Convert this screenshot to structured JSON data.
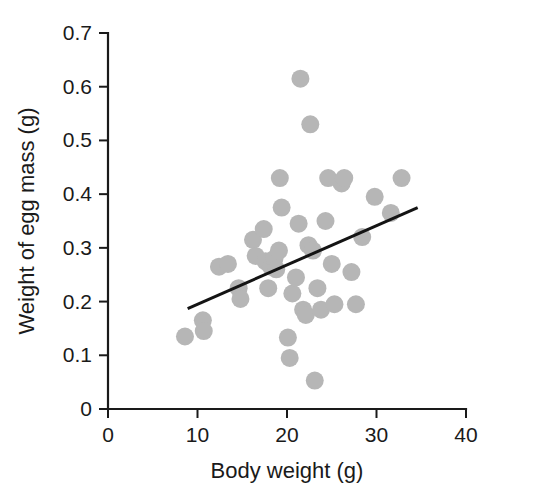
{
  "chart_data": {
    "type": "scatter",
    "title": "",
    "subtitle": "",
    "xlabel": "Body weight (g)",
    "ylabel": "Weight of egg mass (g)",
    "xlim": [
      0,
      40
    ],
    "ylim": [
      0,
      0.7
    ],
    "xticks": [
      0,
      10,
      20,
      30,
      40
    ],
    "yticks": [
      0,
      0.1,
      0.2,
      0.3,
      0.4,
      0.5,
      0.6,
      0.7
    ],
    "xtick_labels": [
      "0",
      "10",
      "20",
      "30",
      "40"
    ],
    "ytick_labels": [
      "0",
      "0.1",
      "0.2",
      "0.3",
      "0.4",
      "0.5",
      "0.6",
      "0.7"
    ],
    "grid": false,
    "legend": null,
    "annotations": [],
    "point_color": "#b6b6b6",
    "point_radius_px": 9,
    "line_color": "#141414",
    "axis_color": "#1a1a1a",
    "series": [
      {
        "name": "Individuals",
        "marker": "circle",
        "points": [
          [
            8.6,
            0.135
          ],
          [
            10.6,
            0.165
          ],
          [
            10.7,
            0.145
          ],
          [
            12.4,
            0.265
          ],
          [
            13.4,
            0.27
          ],
          [
            14.6,
            0.225
          ],
          [
            14.8,
            0.205
          ],
          [
            16.2,
            0.315
          ],
          [
            16.5,
            0.285
          ],
          [
            17.4,
            0.335
          ],
          [
            17.6,
            0.275
          ],
          [
            17.9,
            0.225
          ],
          [
            18.2,
            0.265
          ],
          [
            18.6,
            0.28
          ],
          [
            18.8,
            0.26
          ],
          [
            19.1,
            0.295
          ],
          [
            19.2,
            0.43
          ],
          [
            19.4,
            0.375
          ],
          [
            20.1,
            0.133
          ],
          [
            20.3,
            0.095
          ],
          [
            20.6,
            0.215
          ],
          [
            21.0,
            0.245
          ],
          [
            21.3,
            0.345
          ],
          [
            21.5,
            0.615
          ],
          [
            21.8,
            0.185
          ],
          [
            22.1,
            0.175
          ],
          [
            22.4,
            0.305
          ],
          [
            22.6,
            0.53
          ],
          [
            22.9,
            0.295
          ],
          [
            23.1,
            0.053
          ],
          [
            23.4,
            0.225
          ],
          [
            23.8,
            0.185
          ],
          [
            24.3,
            0.35
          ],
          [
            24.6,
            0.43
          ],
          [
            25.0,
            0.27
          ],
          [
            25.3,
            0.195
          ],
          [
            26.1,
            0.42
          ],
          [
            26.4,
            0.43
          ],
          [
            27.2,
            0.255
          ],
          [
            27.7,
            0.195
          ],
          [
            28.4,
            0.32
          ],
          [
            29.8,
            0.395
          ],
          [
            31.6,
            0.365
          ],
          [
            32.8,
            0.43
          ]
        ]
      }
    ],
    "fit_line": {
      "name": "regression line",
      "x_start": 8.9,
      "y_start": 0.187,
      "x_end": 34.6,
      "y_end": 0.375
    }
  }
}
